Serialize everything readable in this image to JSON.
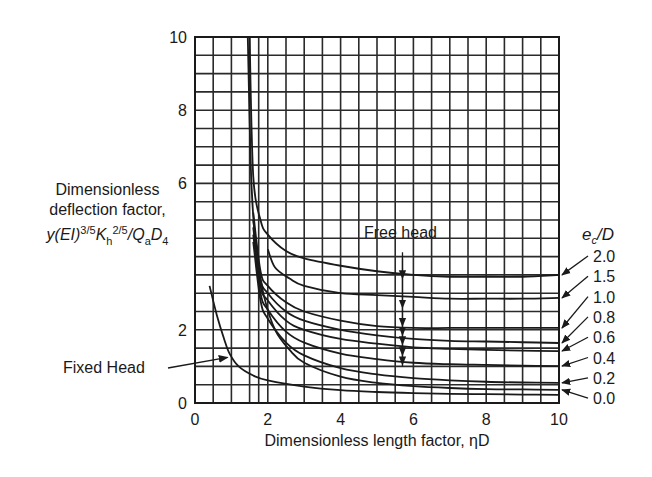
{
  "chart_data": {
    "type": "line",
    "title": "",
    "xlabel": "Dimensionless length factor, ηD",
    "ylabel": {
      "line1": "Dimensionless",
      "line2": "deflection factor,",
      "formula": "y(EI)^{3/5}K_h^{2/5}/Q_a D_4"
    },
    "xlim": [
      0,
      10
    ],
    "ylim": [
      0,
      10
    ],
    "xticks": [
      0,
      2,
      4,
      6,
      8,
      10
    ],
    "yticks": [
      0,
      2,
      4,
      6,
      8,
      10
    ],
    "ytick_labels_shown": [
      "0",
      "2",
      "6",
      "8",
      "10"
    ],
    "grid": true,
    "grid_spacing": 0.5,
    "extra_vertical_gridlines": [
      1.75
    ],
    "legend_title": "e_c/D",
    "annotations": [
      {
        "text": "Free head",
        "x": 5.7,
        "arrow_from_y": 3.9,
        "arrow_to_y": 1.4
      },
      {
        "text": "Fixed Head",
        "arrow_to": [
          0.95,
          1.3
        ]
      }
    ],
    "series": [
      {
        "name": "2.0",
        "points": [
          [
            1.5,
            10
          ],
          [
            1.6,
            6.2
          ],
          [
            1.8,
            5.0
          ],
          [
            2.0,
            4.6
          ],
          [
            2.5,
            4.15
          ],
          [
            3,
            3.95
          ],
          [
            4,
            3.75
          ],
          [
            5,
            3.6
          ],
          [
            6,
            3.5
          ],
          [
            7,
            3.45
          ],
          [
            8,
            3.45
          ],
          [
            9,
            3.45
          ],
          [
            10,
            3.5
          ]
        ]
      },
      {
        "name": "1.5",
        "points": [
          [
            2.0,
            4.2
          ],
          [
            2.2,
            3.7
          ],
          [
            2.6,
            3.4
          ],
          [
            3,
            3.2
          ],
          [
            4,
            3.0
          ],
          [
            5,
            2.95
          ],
          [
            6,
            2.9
          ],
          [
            7,
            2.85
          ],
          [
            8,
            2.85
          ],
          [
            9,
            2.85
          ],
          [
            10,
            2.87
          ]
        ]
      },
      {
        "name": "1.0",
        "points": [
          [
            1.6,
            5.2
          ],
          [
            1.8,
            3.6
          ],
          [
            2.0,
            3.2
          ],
          [
            2.5,
            2.75
          ],
          [
            3,
            2.5
          ],
          [
            4,
            2.25
          ],
          [
            5,
            2.1
          ],
          [
            6,
            2.05
          ],
          [
            7,
            2.05
          ],
          [
            8,
            2.05
          ],
          [
            9,
            2.05
          ],
          [
            10,
            2.05
          ]
        ]
      },
      {
        "name": "0.8",
        "points": [
          [
            1.6,
            5.0
          ],
          [
            1.8,
            3.4
          ],
          [
            2.0,
            3.0
          ],
          [
            2.5,
            2.5
          ],
          [
            3,
            2.25
          ],
          [
            4,
            2.0
          ],
          [
            5,
            1.85
          ],
          [
            6,
            1.75
          ],
          [
            7,
            1.7
          ],
          [
            8,
            1.68
          ],
          [
            9,
            1.66
          ],
          [
            10,
            1.64
          ]
        ]
      },
      {
        "name": "0.6",
        "points": [
          [
            1.6,
            4.8
          ],
          [
            1.8,
            3.2
          ],
          [
            2.0,
            2.8
          ],
          [
            2.5,
            2.25
          ],
          [
            3,
            2.0
          ],
          [
            4,
            1.75
          ],
          [
            5,
            1.62
          ],
          [
            6,
            1.52
          ],
          [
            7,
            1.48
          ],
          [
            8,
            1.45
          ],
          [
            9,
            1.43
          ],
          [
            10,
            1.42
          ]
        ]
      },
      {
        "name": "0.4",
        "points": [
          [
            1.6,
            4.6
          ],
          [
            1.8,
            3.0
          ],
          [
            2.0,
            2.55
          ],
          [
            2.5,
            1.95
          ],
          [
            3,
            1.65
          ],
          [
            4,
            1.35
          ],
          [
            5,
            1.2
          ],
          [
            6,
            1.1
          ],
          [
            7,
            1.06
          ],
          [
            8,
            1.04
          ],
          [
            9,
            1.02
          ],
          [
            10,
            1.01
          ]
        ]
      },
      {
        "name": "0.2",
        "points": [
          [
            1.6,
            4.4
          ],
          [
            1.8,
            2.8
          ],
          [
            2.0,
            2.3
          ],
          [
            2.5,
            1.65
          ],
          [
            3,
            1.3
          ],
          [
            4,
            0.95
          ],
          [
            5,
            0.78
          ],
          [
            6,
            0.68
          ],
          [
            7,
            0.62
          ],
          [
            8,
            0.58
          ],
          [
            9,
            0.56
          ],
          [
            10,
            0.55
          ]
        ]
      },
      {
        "name": "0.0",
        "points": [
          [
            1.45,
            10
          ],
          [
            1.55,
            6.0
          ],
          [
            1.7,
            4.0
          ],
          [
            1.9,
            2.9
          ],
          [
            2.2,
            2.0
          ],
          [
            2.6,
            1.45
          ],
          [
            3,
            1.1
          ],
          [
            4,
            0.72
          ],
          [
            5,
            0.55
          ],
          [
            6,
            0.46
          ],
          [
            7,
            0.41
          ],
          [
            8,
            0.38
          ],
          [
            9,
            0.37
          ],
          [
            10,
            0.36
          ]
        ]
      },
      {
        "name": "Fixed Head",
        "points": [
          [
            0.4,
            3.2
          ],
          [
            0.6,
            2.4
          ],
          [
            0.8,
            1.75
          ],
          [
            0.95,
            1.35
          ],
          [
            1.2,
            1.0
          ],
          [
            1.6,
            0.75
          ],
          [
            2,
            0.62
          ],
          [
            3,
            0.45
          ],
          [
            4,
            0.35
          ],
          [
            5,
            0.3
          ],
          [
            6,
            0.27
          ],
          [
            7,
            0.25
          ],
          [
            8,
            0.24
          ],
          [
            9,
            0.23
          ],
          [
            10,
            0.22
          ]
        ]
      }
    ],
    "legend_entries": [
      "2.0",
      "1.5",
      "1.0",
      "0.8",
      "0.6",
      "0.4",
      "0.2",
      "0.0"
    ]
  },
  "labels": {
    "ylabel_line1": "Dimensionless",
    "ylabel_line2": "deflection factor,",
    "ylabel_formula_parts": [
      "y(EI)",
      "3/5",
      "K",
      "h",
      "2/5",
      "/Q",
      "a",
      "D",
      "4"
    ],
    "xlabel": "Dimensionless length factor, ηD",
    "legend_title_e": "e",
    "legend_title_sub": "c",
    "legend_title_rest": "/D",
    "free_head": "Free head",
    "fixed_head": "Fixed Head"
  },
  "colors": {
    "ink": "#1a1a1a",
    "grid": "#2a2a2a",
    "background": "#ffffff"
  }
}
